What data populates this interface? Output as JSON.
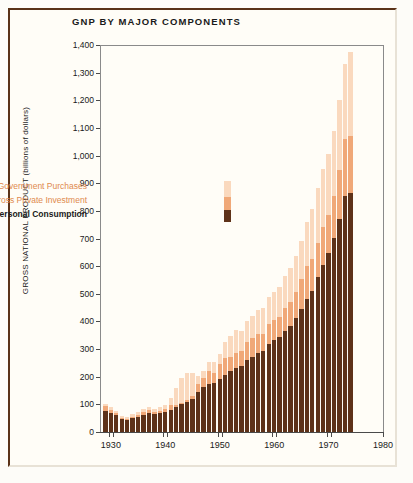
{
  "chart": {
    "title": "GNP BY MAJOR COMPONENTS",
    "ylabel": "GROSS NATIONAL PRODUCT (billions of dollars)"
  },
  "legend": {
    "items": [
      {
        "label": "Government Purchases",
        "color": "#fad9be",
        "key": "government"
      },
      {
        "label": "Gross Private Investment",
        "color": "#f0a878",
        "key": "investment"
      },
      {
        "label": "Personal Consumption",
        "color": "#5e3219",
        "key": "consumption"
      }
    ]
  },
  "chart_data": {
    "type": "bar",
    "subtype": "stacked",
    "title": "GNP BY MAJOR COMPONENTS",
    "xlabel": "",
    "ylabel": "GROSS NATIONAL PRODUCT (billions of dollars)",
    "ylim": [
      0,
      1400
    ],
    "xlim": [
      1928,
      1980
    ],
    "grid": false,
    "legend_position": "inside-left",
    "ytick_labels": [
      "0",
      "100",
      "200",
      "300",
      "400",
      "500",
      "600",
      "700",
      "800",
      "900",
      "1,000",
      "1,100",
      "1,200",
      "1,300",
      "1,400"
    ],
    "yticks": [
      0,
      100,
      200,
      300,
      400,
      500,
      600,
      700,
      800,
      900,
      1000,
      1100,
      1200,
      1300,
      1400
    ],
    "xtick_labels": [
      "1930",
      "1940",
      "1950",
      "1960",
      "1970",
      "1980"
    ],
    "xticks": [
      1930,
      1940,
      1950,
      1960,
      1970,
      1980
    ],
    "categories": [
      1929,
      1930,
      1931,
      1932,
      1933,
      1934,
      1935,
      1936,
      1937,
      1938,
      1939,
      1940,
      1941,
      1942,
      1943,
      1944,
      1945,
      1946,
      1947,
      1948,
      1949,
      1950,
      1951,
      1952,
      1953,
      1954,
      1955,
      1956,
      1957,
      1958,
      1959,
      1960,
      1961,
      1962,
      1963,
      1964,
      1965,
      1966,
      1967,
      1968,
      1969,
      1970,
      1971,
      1972,
      1973,
      1974
    ],
    "series": [
      {
        "name": "Personal Consumption",
        "color": "#5e3219",
        "values": [
          77,
          70,
          61,
          49,
          46,
          52,
          56,
          62,
          67,
          64,
          67,
          71,
          81,
          89,
          100,
          109,
          120,
          144,
          162,
          175,
          178,
          192,
          208,
          219,
          233,
          240,
          259,
          271,
          285,
          294,
          317,
          332,
          343,
          364,
          384,
          412,
          444,
          481,
          509,
          559,
          604,
          648,
          701,
          769,
          852,
          863
        ],
        "label": "Personal consumption expenditures"
      },
      {
        "name": "Gross Private Investment",
        "color": "#f0a878",
        "values": [
          16,
          11,
          6,
          1,
          2,
          3,
          7,
          9,
          12,
          7,
          9,
          13,
          18,
          10,
          6,
          7,
          11,
          31,
          34,
          46,
          36,
          54,
          59,
          52,
          53,
          52,
          68,
          70,
          68,
          61,
          75,
          75,
          72,
          83,
          87,
          94,
          108,
          121,
          116,
          126,
          139,
          136,
          153,
          179,
          209,
          209
        ],
        "label": "Gross private domestic investment"
      },
      {
        "name": "Government Purchases",
        "color": "#fad9be",
        "values": [
          9,
          10,
          10,
          8,
          8,
          10,
          10,
          12,
          12,
          13,
          13,
          14,
          25,
          60,
          89,
          97,
          83,
          28,
          26,
          32,
          38,
          38,
          60,
          76,
          82,
          75,
          75,
          79,
          87,
          95,
          98,
          100,
          108,
          118,
          124,
          129,
          138,
          158,
          180,
          199,
          210,
          220,
          234,
          253,
          269,
          302
        ],
        "label": "Government purchases of goods and services"
      }
    ]
  }
}
